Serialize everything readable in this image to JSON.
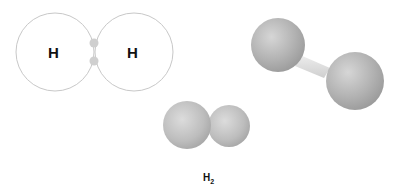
{
  "lewis_diagram": {
    "atoms": [
      {
        "symbol": "H"
      },
      {
        "symbol": "H"
      }
    ],
    "shared_electrons": 2
  },
  "space_filling_model": {
    "formula_main": "H",
    "formula_subscript": "2"
  },
  "ball_and_stick_model": {
    "atoms": 2,
    "bonds": 1
  },
  "colors": {
    "orbit_stroke": "#c8c8c8",
    "electron": "#cfcfcf",
    "atom_sphere": "#b5b5b5",
    "bond": "#e2e2e2"
  }
}
